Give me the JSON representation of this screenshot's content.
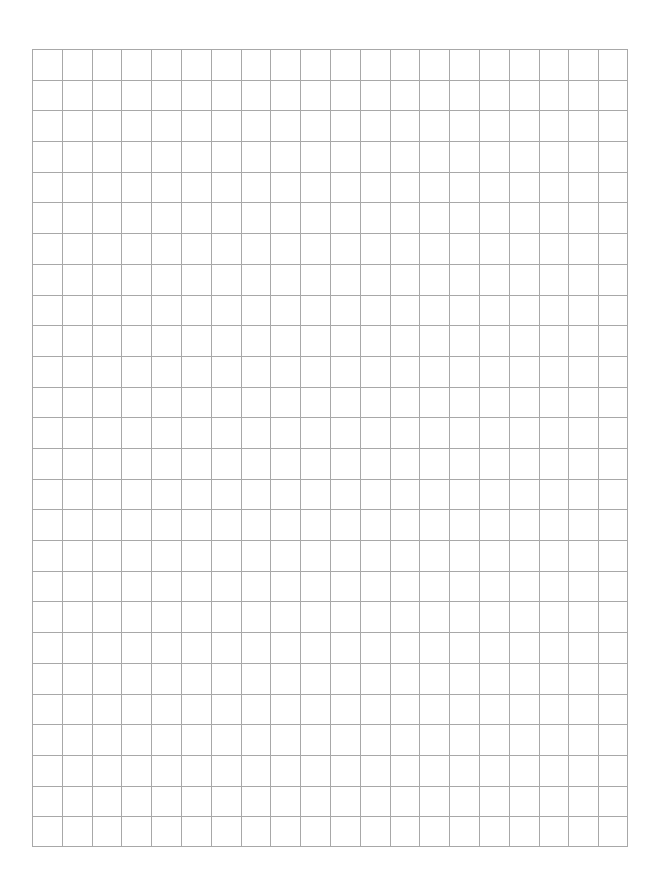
{
  "page": {
    "background": "#ffffff"
  },
  "grid": {
    "columns": 20,
    "rows": 26,
    "line_color": "#a8a8a8",
    "line_width": 1,
    "left": 32,
    "top": 49,
    "width": 596,
    "height": 798
  }
}
